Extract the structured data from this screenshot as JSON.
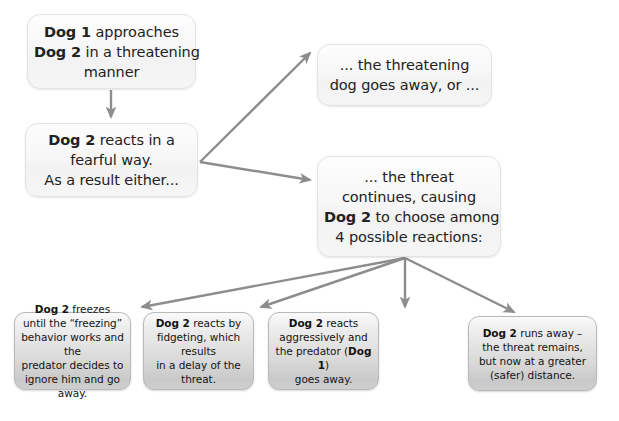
{
  "diagram": {
    "type": "flowchart",
    "background_color": "#ffffff",
    "arrow_color": "#8d8d8d",
    "upper_box_fill": "#f6f6f6",
    "lower_box_fill": "#d6d6d6"
  },
  "nodes": [
    {
      "id": "n1",
      "name": "dog1-approaches",
      "tier": "upper",
      "lines": [
        [
          {
            "t": "Dog 1",
            "b": true
          },
          {
            "t": " approaches",
            "b": false
          }
        ],
        [
          {
            "t": "Dog 2",
            "b": true
          },
          {
            "t": " in a threatening",
            "b": false
          }
        ],
        [
          {
            "t": "manner",
            "b": false
          }
        ]
      ],
      "plain_text": "Dog 1 approaches Dog 2 in a threatening manner",
      "x": 27,
      "y": 14,
      "w": 169,
      "h": 75
    },
    {
      "id": "n2",
      "name": "dog2-reacts-fearful",
      "tier": "upper",
      "lines": [
        [
          {
            "t": "Dog 2",
            "b": true
          },
          {
            "t": " reacts in a",
            "b": false
          }
        ],
        [
          {
            "t": "fearful way.",
            "b": false
          }
        ],
        [
          {
            "t": "As a result either...",
            "b": false
          }
        ]
      ],
      "plain_text": "Dog 2 reacts in a fearful way. As a result either...",
      "x": 25,
      "y": 123,
      "w": 173,
      "h": 74
    },
    {
      "id": "n3",
      "name": "threatening-dog-goes-away",
      "tier": "upper",
      "lines": [
        [
          {
            "t": "... the threatening",
            "b": false
          }
        ],
        [
          {
            "t": "dog goes away, or ...",
            "b": false
          }
        ]
      ],
      "plain_text": "... the threatening dog goes away, or ...",
      "x": 317,
      "y": 44,
      "w": 175,
      "h": 62
    },
    {
      "id": "n4",
      "name": "threat-continues-four-reactions",
      "tier": "upper",
      "lines": [
        [
          {
            "t": "... the threat",
            "b": false
          }
        ],
        [
          {
            "t": "continues, causing",
            "b": false
          }
        ],
        [
          {
            "t": "Dog 2",
            "b": true
          },
          {
            "t": " to choose among",
            "b": false
          }
        ],
        [
          {
            "t": "4 possible reactions:",
            "b": false
          }
        ]
      ],
      "plain_text": "... the threat continues, causing Dog 2 to choose among 4 possible reactions:",
      "x": 317,
      "y": 156,
      "w": 184,
      "h": 101
    },
    {
      "id": "n5",
      "name": "reaction-freeze",
      "tier": "lower",
      "lines": [
        [
          {
            "t": "Dog 2",
            "b": true
          },
          {
            "t": " freezes",
            "b": false
          }
        ],
        [
          {
            "t": "until the “freezing”",
            "b": false
          }
        ],
        [
          {
            "t": "behavior works and the",
            "b": false
          }
        ],
        [
          {
            "t": "predator decides to",
            "b": false
          }
        ],
        [
          {
            "t": "ignore him and go away.",
            "b": false
          }
        ]
      ],
      "plain_text": "Dog 2 freezes until the “freezing” behavior works and the predator decides to ignore him and go away.",
      "x": 14,
      "y": 312,
      "w": 117,
      "h": 78
    },
    {
      "id": "n6",
      "name": "reaction-fidget",
      "tier": "lower",
      "lines": [
        [
          {
            "t": "Dog 2",
            "b": true
          },
          {
            "t": " reacts by",
            "b": false
          }
        ],
        [
          {
            "t": "fidgeting, which results",
            "b": false
          }
        ],
        [
          {
            "t": "in a delay of the threat.",
            "b": false
          }
        ]
      ],
      "plain_text": "Dog 2 reacts by fidgeting, which results in a delay of the threat.",
      "x": 143,
      "y": 312,
      "w": 111,
      "h": 78
    },
    {
      "id": "n7",
      "name": "reaction-aggressive",
      "tier": "lower",
      "lines": [
        [
          {
            "t": "Dog 2",
            "b": true
          },
          {
            "t": " reacts",
            "b": false
          }
        ],
        [
          {
            "t": "aggressively and",
            "b": false
          }
        ],
        [
          {
            "t": "the predator (",
            "b": false
          },
          {
            "t": "Dog 1",
            "b": true
          },
          {
            "t": ")",
            "b": false
          }
        ],
        [
          {
            "t": "goes away.",
            "b": false
          }
        ]
      ],
      "plain_text": "Dog 2 reacts aggressively and the predator (Dog 1) goes away.",
      "x": 268,
      "y": 312,
      "w": 111,
      "h": 78
    },
    {
      "id": "n8",
      "name": "reaction-run-away",
      "tier": "lower",
      "lines": [
        [
          {
            "t": "Dog 2",
            "b": true
          },
          {
            "t": " runs away –",
            "b": false
          }
        ],
        [
          {
            "t": "the threat remains,",
            "b": false
          }
        ],
        [
          {
            "t": "but now at a greater",
            "b": false
          }
        ],
        [
          {
            "t": "(safer) distance.",
            "b": false
          }
        ]
      ],
      "plain_text": "Dog 2 runs away – the threat remains, but now at a greater (safer) distance.",
      "x": 468,
      "y": 316,
      "w": 129,
      "h": 75
    }
  ],
  "connectors": [
    {
      "name": "arrow-n1-to-n2",
      "from": "n1",
      "to": "n2",
      "path": "M 111,90 L 111,118",
      "style": "straight-down"
    },
    {
      "name": "arrow-n2-to-n3",
      "from": "n2",
      "to": "n3",
      "path": "M 200,162 L 311,52",
      "style": "diagonal-up"
    },
    {
      "name": "arrow-n2-to-n4",
      "from": "n2",
      "to": "n4",
      "path": "M 200,162 L 311,180",
      "style": "diagonal-down"
    },
    {
      "name": "arrow-n4-to-n5",
      "from": "n4",
      "to": "n5",
      "path": "M 405,258 L 143,308",
      "style": "fan-left-far"
    },
    {
      "name": "arrow-n4-to-n6",
      "from": "n4",
      "to": "n6",
      "path": "M 405,258 L 262,308",
      "style": "fan-left-near"
    },
    {
      "name": "arrow-n4-to-n7",
      "from": "n4",
      "to": "n7",
      "path": "M 405,258 L 405,308",
      "style": "straight-down"
    },
    {
      "name": "arrow-n4-to-n8",
      "from": "n4",
      "to": "n8",
      "path": "M 405,258 L 513,308",
      "style": "fan-right"
    }
  ]
}
